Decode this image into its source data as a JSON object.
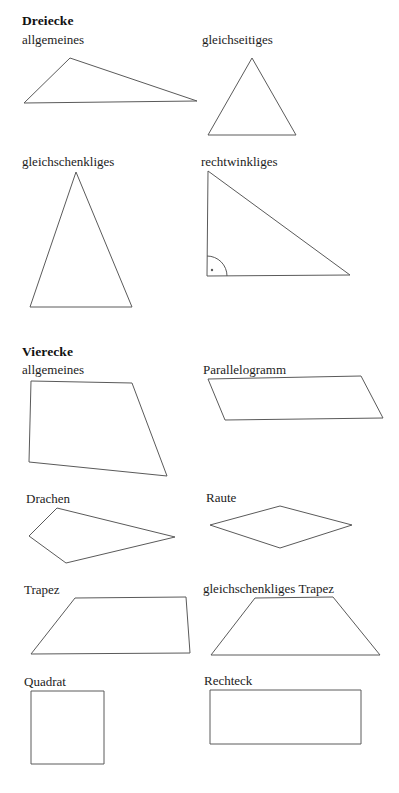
{
  "document": {
    "title": "Dreiecke und Vierecke",
    "background_color": "#ffffff",
    "stroke_color": "#5a5a5a",
    "text_color": "#1a1a1a",
    "width": 399,
    "height": 793
  },
  "sections": [
    {
      "id": "dreiecke",
      "heading": "Dreiecke",
      "figures": [
        {
          "id": "allgemeines-dreieck",
          "label": "allgemeines",
          "shape": "triangle",
          "points": "70,58 197,101 24,103"
        },
        {
          "id": "gleichseitiges-dreieck",
          "label": "gleichseitiges",
          "shape": "triangle",
          "points": "252,58 296,135 208,135"
        },
        {
          "id": "gleichschenkliges-dreieck",
          "label": "gleichschenkliges",
          "shape": "triangle",
          "points": "76,172 132,307 30,307"
        },
        {
          "id": "rechtwinkliges-dreieck",
          "label": "rechtwinkliges",
          "shape": "triangle",
          "points": "208,171 350,275 207,276",
          "right_angle_marker": {
            "vertex_x": 207,
            "vertex_y": 276,
            "radius": 20,
            "dot_x": 212,
            "dot_y": 270
          }
        }
      ]
    },
    {
      "id": "vierecke",
      "heading": "Vierecke",
      "figures": [
        {
          "id": "allgemeines-viereck",
          "label": "allgemeines",
          "shape": "quadrilateral",
          "points": "31,381 132,383 167,476 29,462"
        },
        {
          "id": "parallelogramm",
          "label": "Parallelogramm",
          "shape": "parallelogram",
          "points": "208,379 361,376 383,418 225,420"
        },
        {
          "id": "drachen",
          "label": "Drachen",
          "shape": "kite",
          "points": "57,508 175,537 66,563 29,536"
        },
        {
          "id": "raute",
          "label": "Raute",
          "shape": "rhombus",
          "points": "280,506 352,525 280,548 210,525"
        },
        {
          "id": "trapez",
          "label": "Trapez",
          "shape": "trapezoid",
          "points": "75,598 186,597 190,653 31,654"
        },
        {
          "id": "gleichschenkliges-trapez",
          "label": "gleichschenkliges Trapez",
          "shape": "isosceles-trapezoid",
          "points": "255,598 333,597 380,655 211,655"
        },
        {
          "id": "quadrat",
          "label": "Quadrat",
          "shape": "square",
          "rect": {
            "x": 31,
            "y": 691,
            "width": 73,
            "height": 73
          }
        },
        {
          "id": "rechteck",
          "label": "Rechteck",
          "shape": "rectangle",
          "rect": {
            "x": 210,
            "y": 690,
            "width": 151,
            "height": 54
          }
        }
      ]
    }
  ],
  "label_positions": {
    "dreiecke_heading": {
      "x": 22,
      "y": 14
    },
    "allgemeines_dreieck": {
      "x": 22,
      "y": 33
    },
    "gleichseitiges": {
      "x": 202,
      "y": 33
    },
    "gleichschenkliges": {
      "x": 22,
      "y": 155
    },
    "rechtwinkliges": {
      "x": 201,
      "y": 155
    },
    "vierecke_heading": {
      "x": 22,
      "y": 345
    },
    "allgemeines_viereck": {
      "x": 22,
      "y": 363
    },
    "parallelogramm": {
      "x": 203,
      "y": 363
    },
    "drachen": {
      "x": 26,
      "y": 492
    },
    "raute": {
      "x": 206,
      "y": 491
    },
    "trapez": {
      "x": 24,
      "y": 583
    },
    "gleichschenkliges_trapez": {
      "x": 203,
      "y": 582
    },
    "quadrat": {
      "x": 24,
      "y": 675
    },
    "rechteck": {
      "x": 204,
      "y": 674
    }
  }
}
